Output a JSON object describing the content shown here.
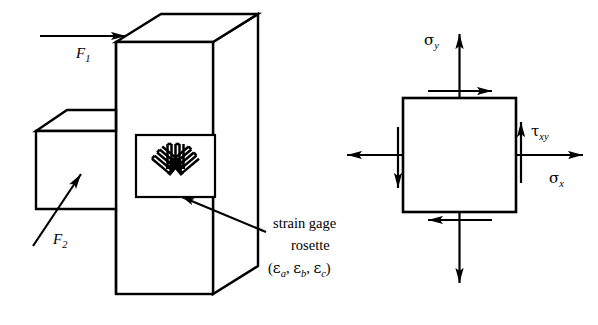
{
  "figure": {
    "stroke_color": "#000000",
    "fill_color": "#ffffff",
    "background": "#ffffff"
  },
  "left_diagram": {
    "name": "bracket-with-rosette",
    "forces": [
      {
        "id": "F1",
        "symbol": "F",
        "subscript": "1",
        "direction": "horizontal-right",
        "description": "Horizontal force applied to the top left of the vertical column"
      },
      {
        "id": "F2",
        "symbol": "F",
        "subscript": "2",
        "direction": "diagonal-up-right",
        "description": "Inclined force applied to the underside of the left shelf"
      }
    ],
    "rosette": {
      "name": "strain-gage-rosette",
      "gage_count": 3,
      "gages": [
        {
          "id": "a",
          "angle_deg": -45,
          "label": "εa"
        },
        {
          "id": "b",
          "angle_deg": 0,
          "label": "εb"
        },
        {
          "id": "c",
          "angle_deg": 45,
          "label": "εc"
        }
      ]
    },
    "caption": {
      "line1": "strain gage",
      "line2": "rosette",
      "line3_open": "(",
      "line3_items": [
        {
          "greek": "ε",
          "sub": "a"
        },
        {
          "greek": "ε",
          "sub": "b"
        },
        {
          "greek": "ε",
          "sub": "c"
        }
      ],
      "line3_separator": ", ",
      "line3_close": ")",
      "line3_plain": "(εa, εb, εc)"
    }
  },
  "right_diagram": {
    "name": "plane-stress-element",
    "element_shape": "square",
    "stresses": [
      {
        "id": "sigma_y",
        "greek": "σ",
        "subscript": "y",
        "type": "normal",
        "axis": "y",
        "sense": "tension",
        "arrow_faces": [
          "top-outward-up",
          "bottom-outward-down"
        ]
      },
      {
        "id": "sigma_x",
        "greek": "σ",
        "subscript": "x",
        "type": "normal",
        "axis": "x",
        "sense": "tension",
        "arrow_faces": [
          "right-outward-right",
          "left-outward-left"
        ]
      },
      {
        "id": "tau_xy",
        "greek": "τ",
        "subscript": "xy",
        "type": "shear",
        "axis": "xy",
        "sense": "positive",
        "arrow_faces": [
          "top-edge-right",
          "bottom-edge-left",
          "right-edge-up",
          "left-edge-down"
        ]
      }
    ]
  }
}
